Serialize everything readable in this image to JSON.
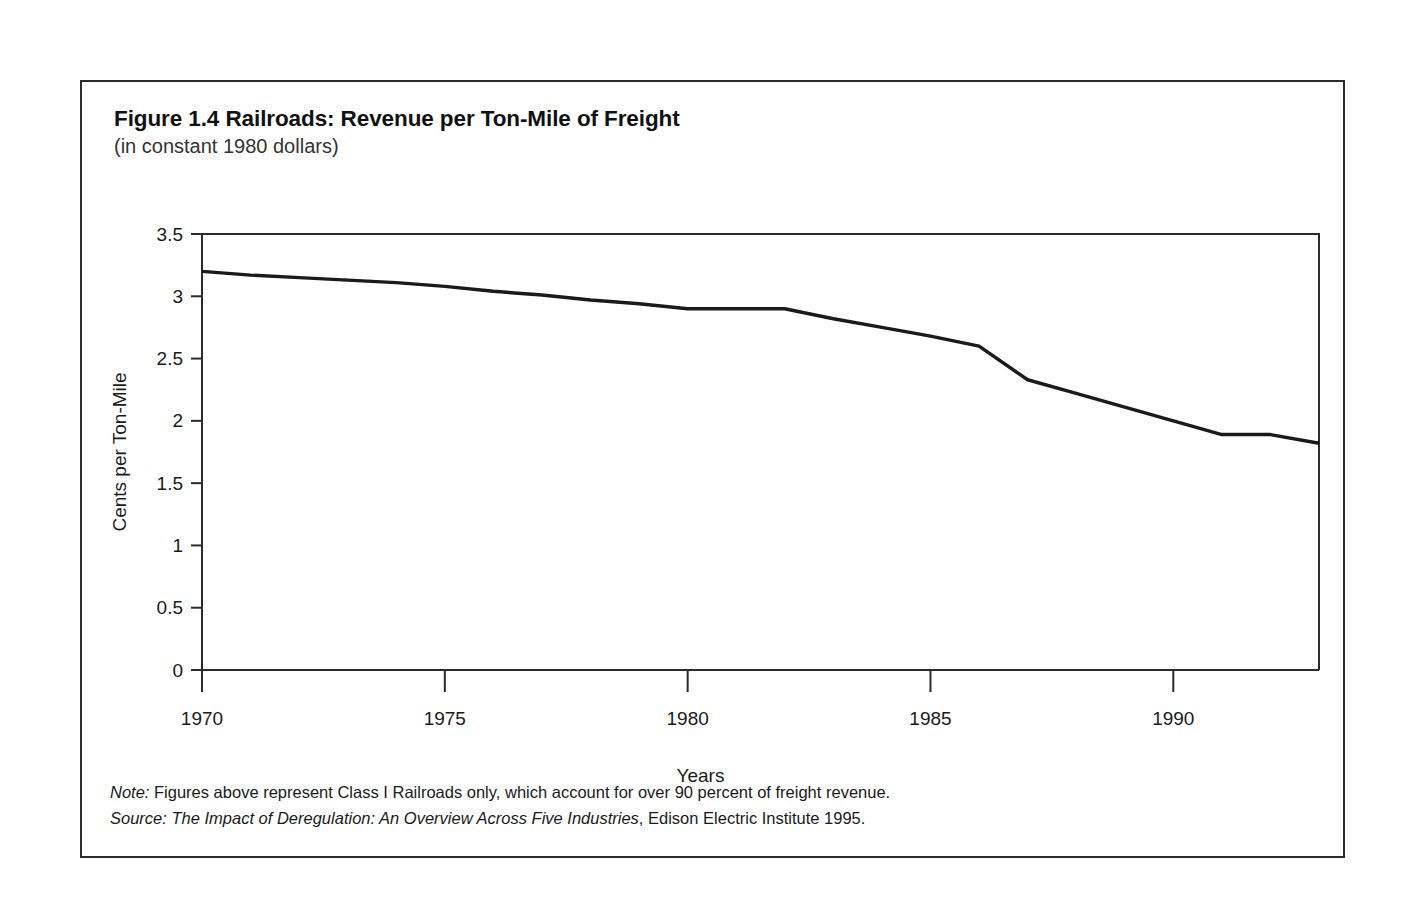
{
  "figure": {
    "title": "Figure 1.4 Railroads: Revenue per Ton-Mile of Freight",
    "subtitle": "(in constant 1980 dollars)",
    "note_label": "Note:",
    "note_text": " Figures above represent Class I Railroads only, which account for over 90 percent of freight revenue.",
    "source_label": "Source:",
    "source_italic": " The Impact of Deregulation: An Overview Across Five Industries",
    "source_rest": ", Edison Electric Institute 1995."
  },
  "colors": {
    "line": "#1a1a1a",
    "axis": "#2b2b2b",
    "border": "#2b2b2b",
    "background": "#ffffff",
    "text": "#1a1a1a"
  },
  "chart_data": {
    "type": "line",
    "title": "Figure 1.4 Railroads: Revenue per Ton-Mile of Freight",
    "subtitle": "(in constant 1980 dollars)",
    "xlabel": "Years",
    "ylabel": "Cents per Ton-Mile",
    "xlim": [
      1970,
      1993
    ],
    "ylim": [
      0,
      3.5
    ],
    "grid": false,
    "legend": false,
    "y_ticks": [
      0,
      0.5,
      1,
      1.5,
      2,
      2.5,
      3,
      3.5
    ],
    "y_tick_labels": [
      "0",
      "0.5",
      "1",
      "1.5",
      "2",
      "2.5",
      "3",
      "3.5"
    ],
    "x_ticks": [
      1970,
      1975,
      1980,
      1985,
      1990
    ],
    "x_tick_labels": [
      "1970",
      "1975",
      "1980",
      "1985",
      "1990"
    ],
    "series": [
      {
        "name": "Revenue per Ton-Mile",
        "x": [
          1970,
          1971,
          1972,
          1973,
          1974,
          1975,
          1976,
          1977,
          1978,
          1979,
          1980,
          1981,
          1982,
          1983,
          1984,
          1985,
          1986,
          1987,
          1988,
          1989,
          1990,
          1991,
          1992,
          1993
        ],
        "values": [
          3.2,
          3.17,
          3.15,
          3.13,
          3.11,
          3.08,
          3.04,
          3.01,
          2.97,
          2.94,
          2.9,
          2.9,
          2.9,
          2.82,
          2.75,
          2.68,
          2.6,
          2.33,
          2.22,
          2.11,
          2.0,
          1.89,
          1.89,
          1.82
        ]
      }
    ]
  }
}
